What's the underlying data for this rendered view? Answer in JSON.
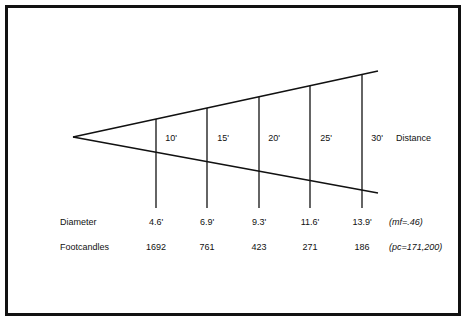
{
  "diagram": {
    "type": "beam-spread-cone",
    "title": "",
    "axis_label": "Distance",
    "row_labels": {
      "diameter": "Diameter",
      "footcandles": "Footcandles"
    },
    "annotations": {
      "multiplying_factor": "(mf=.46)",
      "peak_candela": "(pc=171,200)"
    },
    "columns": [
      {
        "distance": "10'",
        "diameter": "4.6'",
        "footcandles": "1692"
      },
      {
        "distance": "15'",
        "diameter": "6.9'",
        "footcandles": "761"
      },
      {
        "distance": "20'",
        "diameter": "9.3'",
        "footcandles": "423"
      },
      {
        "distance": "25'",
        "diameter": "11.6'",
        "footcandles": "271"
      },
      {
        "distance": "30'",
        "diameter": "13.9'",
        "footcandles": "186"
      }
    ],
    "colors": {
      "line": "#111111",
      "border": "#111111",
      "background": "#ffffff",
      "text": "#111111"
    }
  }
}
